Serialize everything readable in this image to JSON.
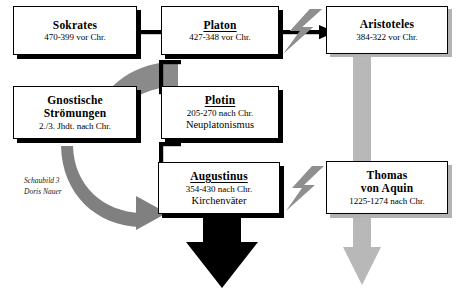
{
  "diagram": {
    "colors": {
      "ink": "#000000",
      "shadow_black": "#000000",
      "shadow_gray": "#b3b3b3",
      "arrow_gray": "#808080",
      "bolt_gray": "#8c8c8c",
      "background": "#ffffff"
    }
  },
  "caption": {
    "line1": "Schaubild 3",
    "line2": "Doris Nauer"
  },
  "nodes": [
    {
      "id": "sokrates",
      "title": "Sokrates",
      "dates": "470-399 vor Chr.",
      "subtitle": "",
      "underline": false,
      "shadow": "black"
    },
    {
      "id": "platon",
      "title": "Platon",
      "dates": "427-348 vor Chr.",
      "subtitle": "",
      "underline": true,
      "shadow": "black"
    },
    {
      "id": "aristoteles",
      "title": "Aristoteles",
      "dates": "384-322 vor Chr.",
      "subtitle": "",
      "underline": false,
      "shadow": "gray"
    },
    {
      "id": "gnostische-stroemungen",
      "title": "Gnostische",
      "title2": "Strömungen",
      "dates": "2./3. Jhdt. nach Chr.",
      "subtitle": "",
      "underline": false,
      "shadow": "black"
    },
    {
      "id": "plotin",
      "title": "Plotin",
      "dates": "205-270 nach Chr.",
      "subtitle": "Neuplatonismus",
      "underline": true,
      "shadow": "black"
    },
    {
      "id": "augustinus",
      "title": "Augustinus",
      "dates": "354-430 nach Chr.",
      "subtitle": "Kirchenväter",
      "underline": true,
      "shadow": "black"
    },
    {
      "id": "thomas-von-aquin",
      "title": "Thomas",
      "title2": "von Aquin",
      "dates": "1225-1274 nach Chr.",
      "subtitle": "",
      "underline": false,
      "shadow": "gray"
    }
  ],
  "connectors": [
    {
      "id": "sokrates-to-platon",
      "style": "black-arrow",
      "from": "sokrates",
      "to": "platon"
    },
    {
      "id": "platon-to-aristoteles",
      "style": "black-arrow",
      "from": "platon",
      "to": "aristoteles"
    },
    {
      "id": "platon-to-plotin",
      "style": "black-line",
      "from": "platon",
      "to": "plotin"
    },
    {
      "id": "plotin-to-augustinus",
      "style": "black-line",
      "from": "plotin",
      "to": "augustinus"
    },
    {
      "id": "platon-to-gnosis-ribbon",
      "style": "gray-ribbon",
      "from": "platon",
      "to": "gnostische-stroemungen"
    },
    {
      "id": "gnosis-to-augustinus",
      "style": "gray-curved-arrow",
      "from": "gnostische-stroemungen",
      "to": "augustinus"
    },
    {
      "id": "aristoteles-to-thomas",
      "style": "gray-down-arrow",
      "from": "aristoteles",
      "to": "thomas-von-aquin"
    },
    {
      "id": "augustinus-down",
      "style": "black-down-arrow",
      "from": "augustinus",
      "to": ""
    },
    {
      "id": "bolt-platon-aristoteles",
      "style": "gray-lightning",
      "from": "platon",
      "to": "aristoteles"
    },
    {
      "id": "bolt-plotin-thomas",
      "style": "gray-lightning",
      "from": "plotin",
      "to": "thomas-von-aquin"
    }
  ]
}
